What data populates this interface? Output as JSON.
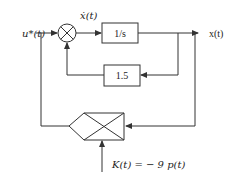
{
  "diagram": {
    "type": "block-diagram",
    "signals": {
      "input": "u*(t)",
      "derivative": "ẋ(t)",
      "output": "x(t)",
      "gain_input": "K(t) = − 9 p(t)"
    },
    "blocks": {
      "integrator": "1/s",
      "feedback_gain": "1.5"
    },
    "nodes": {
      "summing_junction": "summing junction",
      "multiplier": "multiplier"
    },
    "colors": {
      "line": "#333333",
      "background": "#ffffff"
    }
  }
}
